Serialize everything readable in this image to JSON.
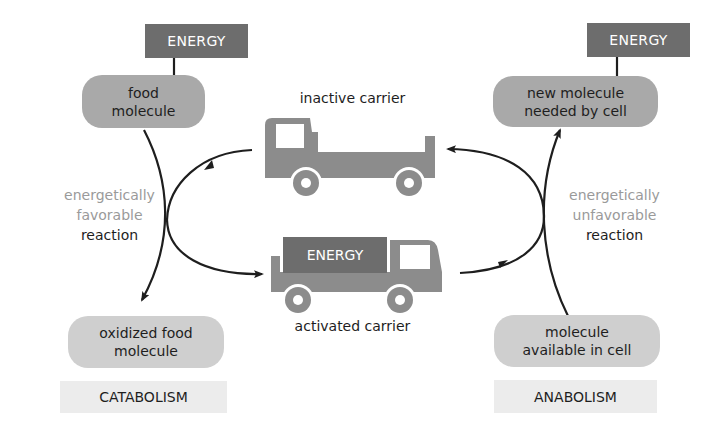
{
  "catabolism": {
    "energy_label": "ENERGY",
    "input_molecule": [
      "food",
      "molecule"
    ],
    "output_molecule": [
      "oxidized food",
      "molecule"
    ],
    "reaction": {
      "line1": "energetically",
      "line2": "favorable",
      "line3": "reaction"
    },
    "category_label": "CATABOLISM"
  },
  "anabolism": {
    "energy_label": "ENERGY",
    "output_molecule": [
      "new molecule",
      "needed by cell"
    ],
    "input_molecule": [
      "molecule",
      "available in cell"
    ],
    "reaction": {
      "line1": "energetically",
      "line2": "unfavorable",
      "line3": "reaction"
    },
    "category_label": "ANABOLISM"
  },
  "carriers": {
    "inactive": {
      "label": "inactive carrier",
      "icon": "truck-empty-icon"
    },
    "activated": {
      "label": "activated carrier",
      "cargo_label": "ENERGY",
      "icon": "truck-loaded-icon"
    }
  },
  "colors": {
    "energy_box": "#6d6d6d",
    "molecule_pill": "#a9a9a9",
    "molecule_pill_light": "#cfcfcf",
    "category_box": "#ececec",
    "truck_body": "#8c8c8c",
    "muted_text": "#9a9a9a",
    "arrow": "#1e1e1e"
  }
}
